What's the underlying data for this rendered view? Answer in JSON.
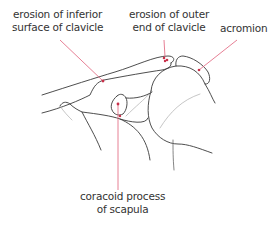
{
  "diagram": {
    "leader_color": "#e0607a",
    "dot_color": "#c8304a",
    "line_color": "#3a3a3a",
    "labels": {
      "inferior_surface": {
        "line1": "erosion of inferior",
        "line2": "surface of clavicle"
      },
      "outer_end": {
        "line1": "erosion of outer",
        "line2": "end of clavicle"
      },
      "acromion": {
        "line1": "acromion"
      },
      "coracoid": {
        "line1": "coracoid process",
        "line2": "of scapula"
      }
    }
  }
}
